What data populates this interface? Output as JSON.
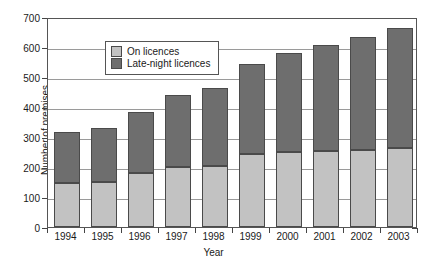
{
  "chart_data": {
    "type": "bar",
    "stacked": true,
    "title": "",
    "xlabel": "Year",
    "ylabel": "Number of premises",
    "categories": [
      "1994",
      "1995",
      "1996",
      "1997",
      "1998",
      "1999",
      "2000",
      "2001",
      "2002",
      "2003"
    ],
    "series": [
      {
        "name": "On licences",
        "color": "#c2c2c2",
        "values": [
          148,
          150,
          180,
          200,
          205,
          243,
          250,
          253,
          258,
          265
        ]
      },
      {
        "name": "Late-night licences",
        "color": "#6e6e6e",
        "values": [
          170,
          180,
          203,
          240,
          260,
          302,
          330,
          355,
          375,
          400
        ]
      }
    ],
    "totals": [
      318,
      330,
      383,
      440,
      465,
      545,
      580,
      608,
      633,
      665
    ],
    "ylim": [
      0,
      700
    ],
    "yticks": [
      0,
      100,
      200,
      300,
      400,
      500,
      600,
      700
    ],
    "ytick_labels": [
      "0",
      "100",
      "200",
      "300",
      "400",
      "500",
      "600",
      "700"
    ],
    "grid": true,
    "legend_position": "top-left",
    "legend": [
      "On licences",
      "Late-night licences"
    ]
  },
  "axis": {
    "y_label": "Number of premises",
    "x_label": "Year"
  }
}
